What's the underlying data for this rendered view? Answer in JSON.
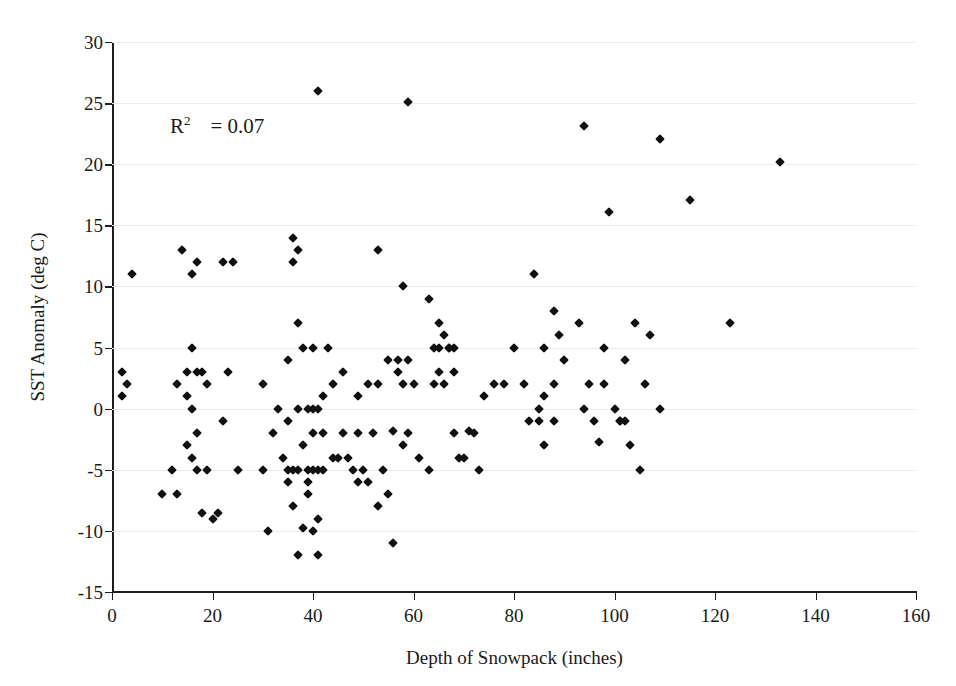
{
  "chart_data": {
    "type": "scatter",
    "title": "",
    "xlabel": "Depth of Snowpack (inches)",
    "ylabel": "SST Anomaly (deg C)",
    "xlim": [
      0,
      160
    ],
    "ylim": [
      -15,
      30
    ],
    "xticks": [
      0,
      20,
      40,
      60,
      80,
      100,
      120,
      140,
      160
    ],
    "yticks": [
      -15,
      -10,
      -5,
      0,
      5,
      10,
      15,
      20,
      25,
      30
    ],
    "grid": "horizontal",
    "legend": "none",
    "marker": "diamond",
    "marker_color": "#111111",
    "annotations": [
      {
        "name": "r-squared",
        "text": "R2   = 0.07",
        "symbol": "R",
        "superscript": "2",
        "equals": "=",
        "value": "0.07",
        "x_data": 10,
        "y_data": 22.5
      }
    ],
    "points": [
      [
        2,
        3
      ],
      [
        2,
        1
      ],
      [
        3,
        2
      ],
      [
        4,
        11
      ],
      [
        10,
        -7
      ],
      [
        12,
        -5
      ],
      [
        13,
        2
      ],
      [
        13,
        -7
      ],
      [
        14,
        13
      ],
      [
        15,
        3
      ],
      [
        15,
        -3
      ],
      [
        15,
        1
      ],
      [
        16,
        11
      ],
      [
        16,
        5
      ],
      [
        16,
        0
      ],
      [
        16,
        -4
      ],
      [
        17,
        12
      ],
      [
        17,
        3
      ],
      [
        17,
        -2
      ],
      [
        17,
        -5
      ],
      [
        18,
        3
      ],
      [
        18,
        -8.5
      ],
      [
        19,
        2
      ],
      [
        19,
        -5
      ],
      [
        20,
        -9
      ],
      [
        21,
        -8.5
      ],
      [
        22,
        12
      ],
      [
        22,
        -1
      ],
      [
        23,
        3
      ],
      [
        24,
        12
      ],
      [
        25,
        -5
      ],
      [
        30,
        2
      ],
      [
        30,
        -5
      ],
      [
        31,
        -10
      ],
      [
        32,
        -2
      ],
      [
        33,
        0
      ],
      [
        34,
        -4
      ],
      [
        35,
        4
      ],
      [
        35,
        -1
      ],
      [
        35,
        -5
      ],
      [
        35,
        -6
      ],
      [
        36,
        14
      ],
      [
        36,
        12
      ],
      [
        36,
        -5
      ],
      [
        36,
        -8
      ],
      [
        37,
        13
      ],
      [
        37,
        7
      ],
      [
        37,
        0
      ],
      [
        37,
        -5
      ],
      [
        37,
        -12
      ],
      [
        38,
        5
      ],
      [
        38,
        -3
      ],
      [
        38,
        -9.8
      ],
      [
        39,
        0
      ],
      [
        39,
        -5
      ],
      [
        39,
        -6
      ],
      [
        39,
        -7
      ],
      [
        40,
        5
      ],
      [
        40,
        0
      ],
      [
        40,
        -2
      ],
      [
        40,
        -5
      ],
      [
        40,
        -10
      ],
      [
        41,
        26
      ],
      [
        41,
        0
      ],
      [
        41,
        -5
      ],
      [
        41,
        -9
      ],
      [
        41,
        -12
      ],
      [
        42,
        1
      ],
      [
        42,
        -2
      ],
      [
        42,
        -5
      ],
      [
        43,
        5
      ],
      [
        44,
        2
      ],
      [
        44,
        -4
      ],
      [
        45,
        -4
      ],
      [
        46,
        3
      ],
      [
        46,
        -2
      ],
      [
        47,
        -4
      ],
      [
        48,
        -5
      ],
      [
        49,
        1
      ],
      [
        49,
        -2
      ],
      [
        49,
        -6
      ],
      [
        50,
        -5
      ],
      [
        51,
        2
      ],
      [
        51,
        -6
      ],
      [
        52,
        -2
      ],
      [
        53,
        13
      ],
      [
        53,
        2
      ],
      [
        53,
        -8
      ],
      [
        54,
        -5
      ],
      [
        55,
        4
      ],
      [
        55,
        -7
      ],
      [
        56,
        -1.8
      ],
      [
        56,
        -11
      ],
      [
        57,
        4
      ],
      [
        57,
        3
      ],
      [
        58,
        10
      ],
      [
        58,
        2
      ],
      [
        58,
        -3
      ],
      [
        59,
        25.1
      ],
      [
        59,
        4
      ],
      [
        59,
        -2
      ],
      [
        60,
        2
      ],
      [
        61,
        -4
      ],
      [
        63,
        9
      ],
      [
        63,
        -5
      ],
      [
        64,
        5
      ],
      [
        64,
        2
      ],
      [
        65,
        7
      ],
      [
        65,
        5
      ],
      [
        65,
        3
      ],
      [
        66,
        6
      ],
      [
        66,
        2
      ],
      [
        67,
        5
      ],
      [
        67,
        5
      ],
      [
        68,
        5
      ],
      [
        68,
        3
      ],
      [
        68,
        -2
      ],
      [
        69,
        -4
      ],
      [
        70,
        -4
      ],
      [
        71,
        -1.8
      ],
      [
        72,
        -2
      ],
      [
        73,
        -5
      ],
      [
        74,
        1
      ],
      [
        76,
        2
      ],
      [
        78,
        2
      ],
      [
        80,
        5
      ],
      [
        82,
        2
      ],
      [
        83,
        -1
      ],
      [
        84,
        11
      ],
      [
        85,
        -1
      ],
      [
        85,
        0
      ],
      [
        86,
        5
      ],
      [
        86,
        1
      ],
      [
        86,
        -3
      ],
      [
        88,
        8
      ],
      [
        88,
        2
      ],
      [
        88,
        -1
      ],
      [
        89,
        6
      ],
      [
        90,
        4
      ],
      [
        93,
        7
      ],
      [
        94,
        23.1
      ],
      [
        94,
        0
      ],
      [
        95,
        2
      ],
      [
        96,
        -1
      ],
      [
        97,
        -2.7
      ],
      [
        98,
        5
      ],
      [
        98,
        2
      ],
      [
        99,
        16.1
      ],
      [
        100,
        0
      ],
      [
        101,
        -1
      ],
      [
        101,
        -1
      ],
      [
        102,
        4
      ],
      [
        102,
        -1
      ],
      [
        103,
        -3
      ],
      [
        104,
        7
      ],
      [
        105,
        -5
      ],
      [
        106,
        2
      ],
      [
        107,
        6
      ],
      [
        109,
        22.1
      ],
      [
        109,
        0
      ],
      [
        115,
        17.1
      ],
      [
        123,
        7
      ],
      [
        133,
        20.2
      ]
    ]
  }
}
